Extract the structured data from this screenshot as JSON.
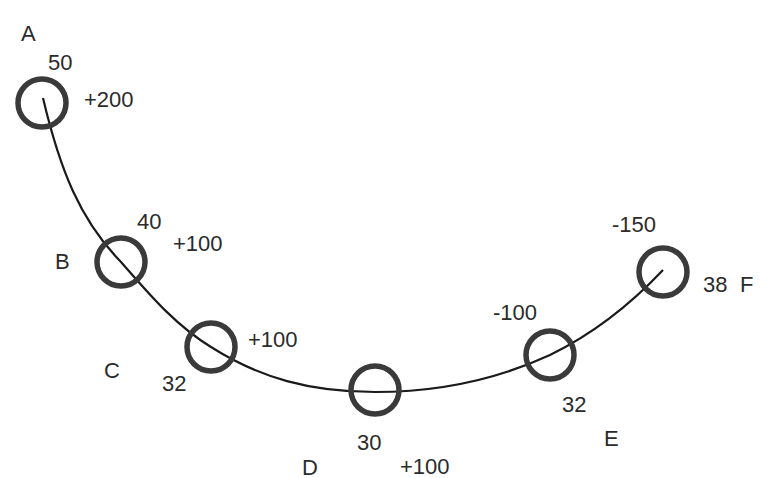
{
  "diagram": {
    "type": "arc-with-stations",
    "stroke_color": "#1a1a1a",
    "ring_color": "#3a3a3a",
    "nodes": [
      {
        "id": "A",
        "label": "A",
        "value": "50",
        "delta": "+200"
      },
      {
        "id": "B",
        "label": "B",
        "value": "40",
        "delta": "+100"
      },
      {
        "id": "C",
        "label": "C",
        "value": "32",
        "delta": "+100"
      },
      {
        "id": "D",
        "label": "D",
        "value": "30",
        "delta": "+100"
      },
      {
        "id": "E",
        "label": "E",
        "value": "32",
        "delta": "-100"
      },
      {
        "id": "F",
        "label": "F",
        "value": "38",
        "delta": "-150"
      }
    ]
  }
}
